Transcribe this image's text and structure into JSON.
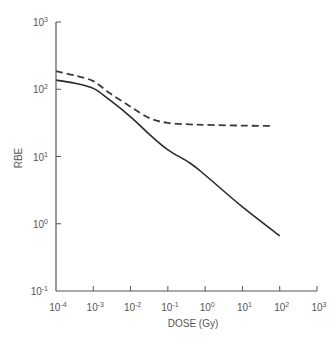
{
  "chart_data": {
    "type": "line",
    "title": "",
    "xlabel": "DOSE (Gy)",
    "ylabel": "RBE",
    "xscale": "log",
    "yscale": "log",
    "xlim": [
      0.0001,
      1000
    ],
    "ylim": [
      0.1,
      1000
    ],
    "grid": false,
    "legend": null,
    "x_ticks": [
      {
        "value": 0.0001,
        "base": "10",
        "exp": "-4"
      },
      {
        "value": 0.001,
        "base": "10",
        "exp": "-3"
      },
      {
        "value": 0.01,
        "base": "10",
        "exp": "-2"
      },
      {
        "value": 0.1,
        "base": "10",
        "exp": "-1"
      },
      {
        "value": 1,
        "base": "10",
        "exp": "0"
      },
      {
        "value": 10,
        "base": "10",
        "exp": "1"
      },
      {
        "value": 100,
        "base": "10",
        "exp": "2"
      },
      {
        "value": 1000,
        "base": "10",
        "exp": "3"
      }
    ],
    "y_ticks": [
      {
        "value": 0.1,
        "base": "10",
        "exp": "-1"
      },
      {
        "value": 1,
        "base": "10",
        "exp": "0"
      },
      {
        "value": 10,
        "base": "10",
        "exp": "1"
      },
      {
        "value": 100,
        "base": "10",
        "exp": "2"
      },
      {
        "value": 1000,
        "base": "10",
        "exp": "3"
      }
    ],
    "series": [
      {
        "name": "dashed curve",
        "style": "dashed",
        "x": [
          0.0001,
          0.00032,
          0.001,
          0.0028,
          0.01,
          0.033,
          0.1,
          0.39,
          1,
          10,
          69
        ],
        "values": [
          186,
          160,
          132,
          87,
          55,
          37,
          31.6,
          30,
          29.5,
          28.8,
          28.5
        ]
      },
      {
        "name": "solid curve",
        "style": "solid",
        "x": [
          0.0001,
          0.00032,
          0.001,
          0.0028,
          0.01,
          0.033,
          0.1,
          0.39,
          1,
          10,
          100
        ],
        "values": [
          137,
          123,
          103,
          69,
          39,
          21,
          12.6,
          8,
          5.3,
          1.78,
          0.66
        ]
      }
    ]
  },
  "colors": {
    "axis": "#555555",
    "line": "#2a2a2a"
  }
}
